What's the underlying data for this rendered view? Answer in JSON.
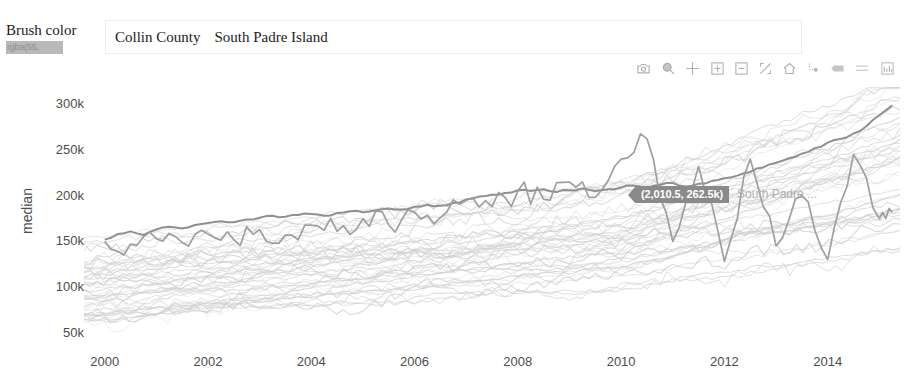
{
  "brush": {
    "label": "Brush color",
    "swatch_value": "rgba(55,",
    "swatch_color": "#b9b9b9"
  },
  "selection": {
    "items": [
      {
        "label": "Collin County"
      },
      {
        "label": "South Padre Island"
      }
    ]
  },
  "modebar": {
    "buttons": [
      {
        "name": "download-plot-icon",
        "title": "Download plot as a png"
      },
      {
        "name": "zoom-icon",
        "title": "Zoom"
      },
      {
        "name": "pan-icon",
        "title": "Pan"
      },
      {
        "name": "zoom-in-icon",
        "title": "Zoom in"
      },
      {
        "name": "zoom-out-icon",
        "title": "Zoom out"
      },
      {
        "name": "autoscale-icon",
        "title": "Autoscale"
      },
      {
        "name": "reset-axes-icon",
        "title": "Reset axes"
      },
      {
        "name": "toggle-spike-lines-icon",
        "title": "Toggle Spike Lines"
      },
      {
        "name": "hover-closest-icon",
        "title": "Show closest data on hover"
      },
      {
        "name": "hover-compare-icon",
        "title": "Compare data on hover"
      },
      {
        "name": "plotly-logo-icon",
        "title": "Produced with Plotly"
      }
    ]
  },
  "tooltip": {
    "text": "(2,010.5, 262.5k)",
    "trace_annotation": "South Padre ..."
  },
  "chart_data": {
    "type": "line",
    "title": "",
    "xlabel": "",
    "ylabel": "median",
    "xlim": [
      1999.6,
      2015.4
    ],
    "ylim": [
      40000,
      320000
    ],
    "xticks": [
      2000,
      2002,
      2004,
      2006,
      2008,
      2010,
      2012,
      2014
    ],
    "xticklabels": [
      "2000",
      "2002",
      "2004",
      "2006",
      "2008",
      "2010",
      "2012",
      "2014"
    ],
    "yticks": [
      50000,
      100000,
      150000,
      200000,
      250000,
      300000
    ],
    "yticklabels": [
      "50k",
      "100k",
      "150k",
      "200k",
      "250k",
      "300k"
    ],
    "grid": false,
    "legend_position": "none",
    "background_series_color": "#cfcfcf",
    "highlight_series_color": "#8a8a8a",
    "background_series_count": 46,
    "series": [
      {
        "name": "Collin County",
        "highlighted": true,
        "color": "#8a8a8a",
        "x": [
          2000.0,
          2000.25,
          2000.5,
          2000.75,
          2001.0,
          2001.25,
          2001.5,
          2001.75,
          2002.0,
          2002.25,
          2002.5,
          2002.75,
          2003.0,
          2003.25,
          2003.5,
          2003.75,
          2004.0,
          2004.25,
          2004.5,
          2004.75,
          2005.0,
          2005.25,
          2005.5,
          2005.75,
          2006.0,
          2006.25,
          2006.5,
          2006.75,
          2007.0,
          2007.25,
          2007.5,
          2007.75,
          2008.0,
          2008.25,
          2008.5,
          2008.75,
          2009.0,
          2009.25,
          2009.5,
          2009.75,
          2010.0,
          2010.25,
          2010.5,
          2010.75,
          2011.0,
          2011.25,
          2011.5,
          2011.75,
          2012.0,
          2012.25,
          2012.5,
          2012.75,
          2013.0,
          2013.25,
          2013.5,
          2013.75,
          2014.0,
          2014.25,
          2014.5,
          2014.75,
          2015.0,
          2015.25
        ],
        "y": [
          152000,
          158000,
          161000,
          157000,
          163000,
          166000,
          164000,
          168000,
          170000,
          172000,
          171000,
          174000,
          176000,
          178000,
          177000,
          179000,
          180000,
          178000,
          181000,
          183000,
          182000,
          184000,
          186000,
          185000,
          188000,
          190000,
          189000,
          192000,
          196000,
          199000,
          201000,
          203000,
          206000,
          205000,
          207000,
          204000,
          206000,
          208000,
          205000,
          207000,
          209000,
          211000,
          208000,
          212000,
          214000,
          210000,
          213000,
          216000,
          219000,
          222000,
          226000,
          231000,
          236000,
          241000,
          246000,
          252000,
          258000,
          262000,
          268000,
          276000,
          288000,
          299000
        ]
      },
      {
        "name": "South Padre Island",
        "highlighted": true,
        "color": "#9a9a9a",
        "x": [
          2000.0,
          2000.5,
          2001.0,
          2001.5,
          2002.0,
          2002.5,
          2003.0,
          2003.5,
          2004.0,
          2004.5,
          2005.0,
          2005.5,
          2006.0,
          2006.5,
          2007.0,
          2007.5,
          2008.0,
          2008.5,
          2009.0,
          2009.5,
          2010.0,
          2010.5,
          2011.0,
          2011.5,
          2012.0,
          2012.5,
          2013.0,
          2013.5,
          2014.0,
          2014.5,
          2015.0,
          2015.25
        ],
        "y": [
          150000,
          147000,
          153000,
          149000,
          158000,
          152000,
          163000,
          157000,
          168000,
          161000,
          175000,
          168000,
          182000,
          176000,
          195000,
          188000,
          205000,
          196000,
          215000,
          198000,
          240000,
          262500,
          150000,
          232000,
          128000,
          240000,
          145000,
          200000,
          130000,
          245000,
          175000,
          182000
        ]
      }
    ],
    "hover_point": {
      "x": 2010.5,
      "y": 262500,
      "label": "(2,010.5, 262.5k)"
    }
  }
}
